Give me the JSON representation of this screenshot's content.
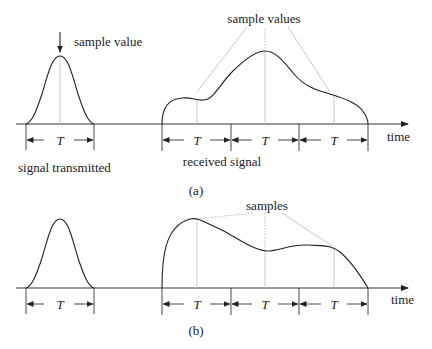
{
  "figure": {
    "panel_a": {
      "caption": "(a)",
      "transmitted_label": "sample value",
      "transmitted_caption": "signal transmitted",
      "received_label": "sample values",
      "received_caption": "received signal",
      "axis_label": "time",
      "interval_labels": [
        "T",
        "T",
        "T",
        "T"
      ]
    },
    "panel_b": {
      "caption": "(b)",
      "received_label": "samples",
      "axis_label": "time",
      "interval_labels": [
        "T",
        "T",
        "T",
        "T"
      ]
    }
  }
}
